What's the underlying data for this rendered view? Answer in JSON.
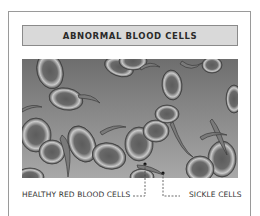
{
  "title": "ABNORMAL BLOOD CELLS",
  "labels": {
    "healthy": "HEALTHY RED BLOOD CELLS",
    "sickle": "SICKLE CELLS"
  },
  "colors": {
    "frame_border": "#9a9a9a",
    "title_bg": "#d9d9d9",
    "background_top": "#6e6e6e",
    "background_bottom": "#a8a8a8"
  }
}
